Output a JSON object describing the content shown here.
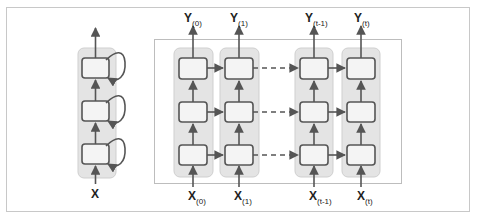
{
  "diagram": {
    "colors": {
      "frame": "#c8c8c8",
      "column_fill": "#e4e4e4",
      "column_stroke": "#c9c9c9",
      "cell_fill": "#f4f4f4",
      "cell_stroke": "#555555",
      "arrow": "#555555"
    },
    "rolled": {
      "input_label": "X",
      "cells": 3,
      "has_recurrent_loops": true
    },
    "unrolled": {
      "columns": [
        {
          "output_label": "Y",
          "output_sub": "(0)",
          "input_label": "X",
          "input_sub": "(0)"
        },
        {
          "output_label": "Y",
          "output_sub": "(1)",
          "input_label": "X",
          "input_sub": "(1)"
        },
        {
          "output_label": "Y",
          "output_sub": "(t-1)",
          "input_label": "X",
          "input_sub": "(t-1)"
        },
        {
          "output_label": "Y",
          "output_sub": "(t)",
          "input_label": "X",
          "input_sub": "(t)"
        }
      ],
      "cells_per_column": 3,
      "gap_connector": "dashed"
    }
  }
}
